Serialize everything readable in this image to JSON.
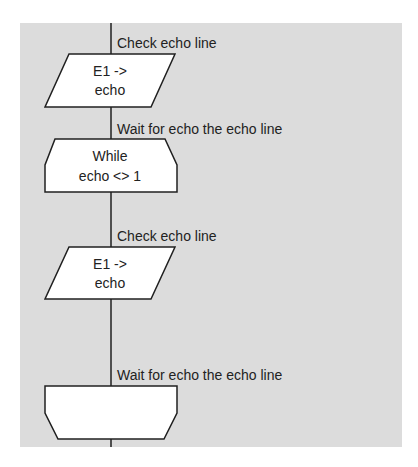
{
  "flowchart": {
    "background_color": "#dcdcdc",
    "line_color": "#202020",
    "blocks": [
      {
        "type": "io",
        "label": "Check echo line",
        "text_line1": "E1 ->",
        "text_line2": "echo"
      },
      {
        "type": "loop-start",
        "label": "Wait for echo the echo line",
        "text_line1": "While",
        "text_line2": "echo <> 1"
      },
      {
        "type": "io",
        "label": "Check echo line",
        "text_line1": "E1 ->",
        "text_line2": "echo"
      },
      {
        "type": "loop-end",
        "label": "Wait for echo the echo line",
        "text_line1": "",
        "text_line2": ""
      }
    ]
  }
}
